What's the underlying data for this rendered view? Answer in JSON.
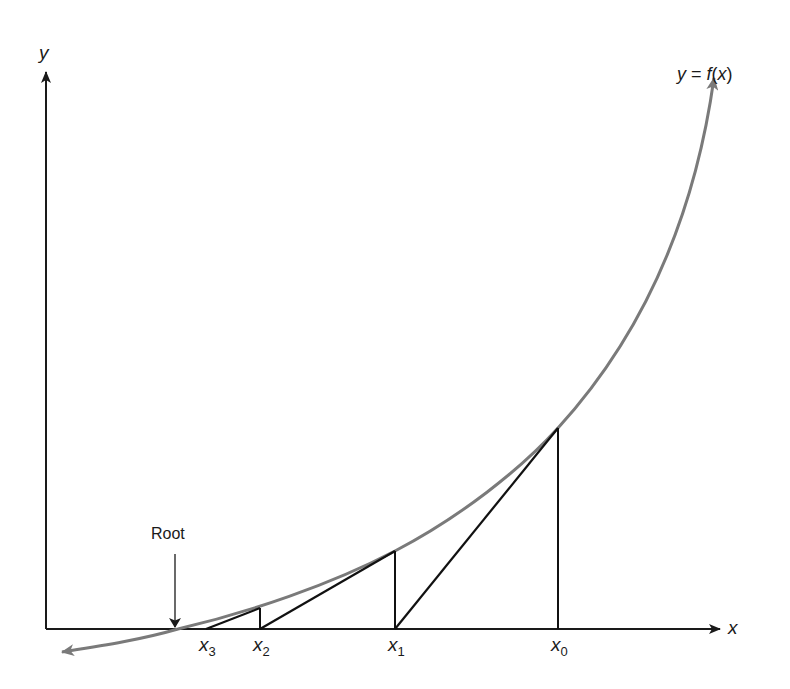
{
  "diagram": {
    "curve_label": {
      "lhs": "y",
      "eq": " = ",
      "f": "f",
      "open": "(",
      "x": "x",
      "close": ")"
    },
    "axes": {
      "x_label": "x",
      "y_label": "y"
    },
    "root_label": "Root",
    "iterates": [
      {
        "name": "x",
        "sub": "0"
      },
      {
        "name": "x",
        "sub": "1"
      },
      {
        "name": "x",
        "sub": "2"
      },
      {
        "name": "x",
        "sub": "3"
      }
    ],
    "colors": {
      "axes": "#1a1a1a",
      "curve": "#7a7a7a",
      "tangents": "#111111",
      "background": "#ffffff"
    }
  }
}
